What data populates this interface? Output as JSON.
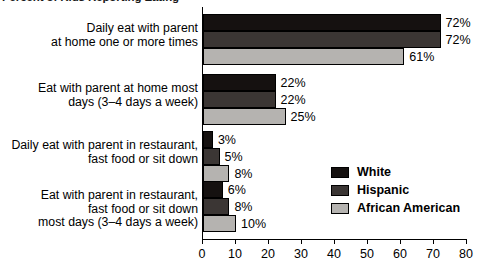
{
  "chart_data": {
    "type": "bar",
    "orientation": "horizontal",
    "title": "Percent of Kids Reporting Eating",
    "xlabel": "",
    "ylabel": "",
    "xlim": [
      0,
      80
    ],
    "xticks": [
      0,
      10,
      20,
      30,
      40,
      50,
      60,
      70,
      80
    ],
    "grid": false,
    "legend_position": "middle-right",
    "categories": [
      "Daily eat with parent\nat home one or more times",
      "Eat with parent at home most\ndays (3–4 days a week)",
      "Daily eat with parent in restaurant,\nfast food or sit down",
      "Eat with parent in restaurant,\nfast food or sit down\nmost days (3–4 days a week)"
    ],
    "series": [
      {
        "name": "White",
        "color": "#151110",
        "values": [
          72,
          22,
          3,
          6
        ],
        "labels": [
          "72%",
          "22%",
          "3%",
          "6%"
        ]
      },
      {
        "name": "Hispanic",
        "color": "#3b3634",
        "values": [
          72,
          22,
          5,
          8
        ],
        "labels": [
          "72%",
          "22%",
          "5%",
          "8%"
        ]
      },
      {
        "name": "African American",
        "color": "#b5b3b0",
        "values": [
          61,
          25,
          8,
          10
        ],
        "labels": [
          "61%",
          "25%",
          "8%",
          "10%"
        ]
      }
    ]
  },
  "axis": {
    "tick_labels": [
      "0",
      "10",
      "20",
      "30",
      "40",
      "50",
      "60",
      "70",
      "80"
    ]
  }
}
